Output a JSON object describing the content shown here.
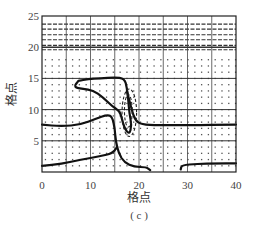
{
  "chart_data": {
    "type": "contour",
    "title": "",
    "caption": "( c )",
    "xlabel": "格点",
    "ylabel": "格点",
    "xlim": [
      0,
      40
    ],
    "ylim": [
      0,
      25
    ],
    "x_ticks": [
      0,
      10,
      20,
      30,
      40
    ],
    "x_tick_labels": [
      "0",
      "10",
      "20",
      "30",
      "40"
    ],
    "y_ticks": [
      5,
      10,
      15,
      20,
      25
    ],
    "y_tick_labels": [
      "5",
      "10",
      "15",
      "20",
      "25"
    ],
    "grid": true,
    "grid_major_x": [
      5,
      10,
      15,
      20,
      25,
      30,
      35
    ],
    "grid_major_y": [
      5,
      10,
      15,
      20
    ],
    "background_pattern": "dotted grid-point field; horizontal dashed lines in band y=19-24",
    "dashed_rows_y": [
      19.6,
      20.3,
      21.2,
      22.0,
      22.9,
      23.7
    ],
    "contours": [
      {
        "name": "upper-closed-contour",
        "style": "solid-thick",
        "points": [
          [
            7.5,
            14.6
          ],
          [
            6.5,
            13.6
          ],
          [
            8.5,
            13.3
          ],
          [
            10.5,
            13.1
          ],
          [
            12.5,
            12.0
          ],
          [
            14.5,
            10.5
          ],
          [
            16.0,
            9.8
          ],
          [
            16.5,
            8.5
          ],
          [
            17.0,
            7.0
          ],
          [
            18.0,
            6.0
          ],
          [
            18.5,
            7.5
          ],
          [
            18.0,
            9.5
          ],
          [
            17.8,
            11.5
          ],
          [
            17.5,
            13.5
          ],
          [
            17.0,
            15.0
          ],
          [
            15.0,
            15.2
          ],
          [
            12.0,
            15.0
          ],
          [
            9.5,
            14.9
          ],
          [
            7.5,
            14.6
          ]
        ]
      },
      {
        "name": "left-middle-contour",
        "style": "solid-thick",
        "points": [
          [
            0,
            7.6
          ],
          [
            4,
            7.3
          ],
          [
            8,
            7.6
          ],
          [
            11,
            8.5
          ],
          [
            13.5,
            9.2
          ],
          [
            14.5,
            8.8
          ],
          [
            15.0,
            7.0
          ],
          [
            15.2,
            5.0
          ],
          [
            15.8,
            3.0
          ],
          [
            17.0,
            1.5
          ],
          [
            19.0,
            0.8
          ],
          [
            21.5,
            0.8
          ],
          [
            22.3,
            0.3
          ]
        ]
      },
      {
        "name": "bottom-left-contour",
        "style": "solid-thick",
        "points": [
          [
            0,
            1.0
          ],
          [
            4,
            1.3
          ],
          [
            8,
            2.0
          ],
          [
            12,
            2.5
          ],
          [
            14.5,
            3.0
          ],
          [
            15.5,
            4.0
          ]
        ]
      },
      {
        "name": "right-middle-contour",
        "style": "solid-thick",
        "points": [
          [
            17.5,
            13.0
          ],
          [
            18.5,
            10.0
          ],
          [
            19.2,
            8.3
          ],
          [
            20.5,
            7.6
          ],
          [
            24,
            7.5
          ],
          [
            30,
            7.5
          ],
          [
            40,
            7.6
          ]
        ]
      },
      {
        "name": "bottom-right-contour",
        "style": "solid-thick",
        "points": [
          [
            28.6,
            0.4
          ],
          [
            28.8,
            1.1
          ],
          [
            32,
            1.3
          ],
          [
            36,
            1.4
          ],
          [
            40,
            1.4
          ]
        ]
      },
      {
        "name": "central-ellipse",
        "style": "dashed",
        "center": [
          18.0,
          9.5
        ],
        "rx": 1.5,
        "ry": 3.8
      },
      {
        "name": "inner-ellipse",
        "style": "dashed",
        "center": [
          17.8,
          9.8
        ],
        "rx": 0.8,
        "ry": 2.6
      }
    ]
  },
  "labels": {
    "xlabel": "格点",
    "ylabel": "格点",
    "caption": "( c )",
    "x_ticks": [
      "0",
      "10",
      "20",
      "30",
      "40"
    ],
    "y_ticks": [
      "5",
      "10",
      "15",
      "20",
      "25"
    ]
  }
}
